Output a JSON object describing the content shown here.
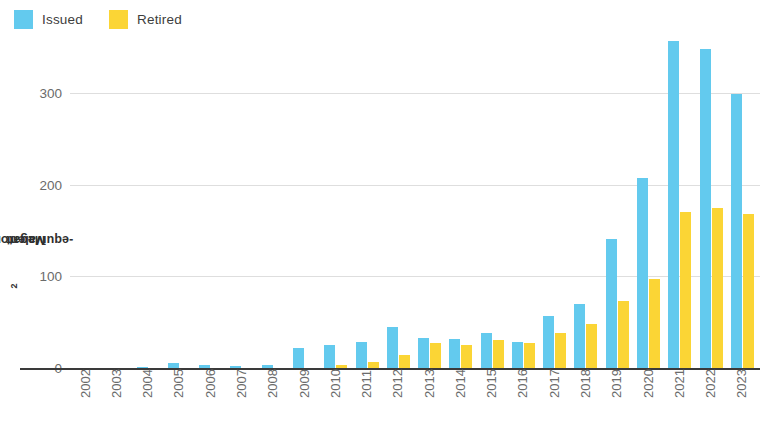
{
  "legend": {
    "position": "top-left",
    "items": [
      {
        "label": "Issued",
        "color": "#63caee",
        "icon": "color-swatch-icon"
      },
      {
        "label": "Retired",
        "color": "#fbd535",
        "icon": "color-swatch-icon"
      }
    ]
  },
  "axes": {
    "y_title_prefix": "Megatons of CO",
    "y_title_sub": "2",
    "y_title_suffix": "-equivalent",
    "y_ticks": [
      "0",
      "100",
      "200",
      "300"
    ]
  },
  "chart_data": {
    "type": "bar",
    "title": "",
    "subtitle": "",
    "xlabel": "",
    "ylabel": "Megatons of CO2-equivalent",
    "ylim": [
      0,
      380
    ],
    "yticks": [
      0,
      100,
      200,
      300
    ],
    "grid": true,
    "legend_position": "top-left",
    "categories": [
      "2002",
      "2003",
      "2004",
      "2005",
      "2006",
      "2007",
      "2008",
      "2009",
      "2010",
      "2011",
      "2012",
      "2013",
      "2014",
      "2015",
      "2016",
      "2017",
      "2018",
      "2019",
      "2020",
      "2021",
      "2022",
      "2023"
    ],
    "series": [
      {
        "name": "Issued",
        "color": "#63caee",
        "values": [
          0,
          0,
          1,
          6,
          3,
          2,
          3,
          22,
          25,
          28,
          45,
          33,
          32,
          38,
          28,
          57,
          70,
          141,
          207,
          357,
          348,
          299
        ]
      },
      {
        "name": "Retired",
        "color": "#fbd535",
        "values": [
          0,
          0,
          0,
          0,
          0,
          0,
          0,
          0,
          3,
          7,
          14,
          27,
          25,
          31,
          27,
          38,
          48,
          73,
          97,
          170,
          175,
          168
        ]
      }
    ]
  }
}
